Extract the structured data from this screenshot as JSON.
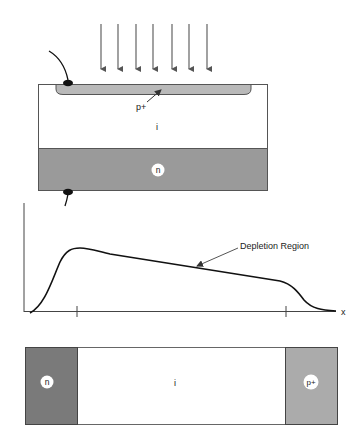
{
  "colors": {
    "n_top": "#9a9a9a",
    "p_plus_top": "#b9b9b9",
    "n_bottom": "#7a7a7a",
    "p_plus_bottom": "#ababab",
    "intrinsic": "#ffffff",
    "line": "#222222",
    "arrow": "#555555"
  },
  "device": {
    "p_plus_label": "p+",
    "intrinsic_label": "i",
    "n_label": "n",
    "incident_arrows": 7
  },
  "field_plot": {
    "x_axis_label": "x",
    "annotation": "Depletion Region"
  },
  "bar": {
    "n_label": "n",
    "intrinsic_label": "i",
    "p_plus_label": "p+"
  }
}
